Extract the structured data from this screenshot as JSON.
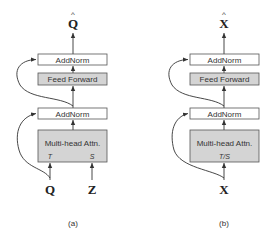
{
  "diagrams": [
    {
      "caption": "(a)",
      "output": "Q",
      "output_hat": "^",
      "blocks": {
        "addnorm_top": "AddNorm",
        "feed_forward": "Feed Forward",
        "addnorm_bottom": "AddNorm",
        "attention": "Multi-head Attn.",
        "attention_inputs": [
          "T",
          "S"
        ]
      },
      "inputs": [
        "Q",
        "Z"
      ]
    },
    {
      "caption": "(b)",
      "output": "X",
      "output_hat": "^",
      "blocks": {
        "addnorm_top": "AddNorm",
        "feed_forward": "Feed Forward",
        "addnorm_bottom": "AddNorm",
        "attention": "Multi-head Attn.",
        "attention_inputs": [
          "T/S"
        ]
      },
      "inputs": [
        "X"
      ]
    }
  ],
  "colors": {
    "white_box": "#ffffff",
    "gray_box": "#d4d4d4",
    "stroke": "#555555"
  }
}
